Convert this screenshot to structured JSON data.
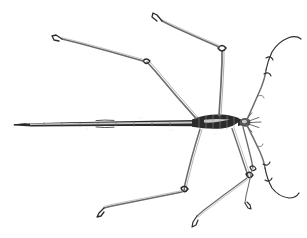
{
  "figure": {
    "view": "dorsal",
    "orientation": "head-right-abdomen-left",
    "background_color": "#ffffff",
    "ink_color": "#2b2b2b",
    "ink_soft_color": "#6b6b6b",
    "ink_faint_color": "#9a9a9a",
    "highlight_color": "#c9c9c9",
    "canvas": {
      "width": 307,
      "height": 238
    },
    "caption": "",
    "labels": []
  },
  "anatomy": {
    "abdomen": {
      "name": "abdomen",
      "tip_x": 14,
      "tip_y": 124,
      "base_x": 196,
      "base_y": 122,
      "segments": 8
    },
    "thorax": {
      "name": "thorax",
      "x": 196,
      "y": 120,
      "width": 42,
      "height": 12
    },
    "head": {
      "name": "head",
      "x": 243,
      "y": 120,
      "radius": 5
    },
    "antennae": [
      {
        "name": "antenna-upper-right",
        "side": "right",
        "position": "upper",
        "tip_x": 300,
        "tip_y": 40
      },
      {
        "name": "antenna-lower-right",
        "side": "right",
        "position": "lower",
        "tip_x": 296,
        "tip_y": 196
      }
    ],
    "legs": [
      {
        "name": "leg-foreleg-left-upper",
        "pair": "foreleg",
        "side": "upper-left",
        "femur_joint_x": 146,
        "femur_joint_y": 63,
        "tarsus_tip_x": 53,
        "tarsus_tip_y": 39
      },
      {
        "name": "leg-midleg-left-upper",
        "pair": "midleg",
        "side": "upper-middle",
        "femur_joint_x": 222,
        "femur_joint_y": 50,
        "tarsus_tip_x": 156,
        "tarsus_tip_y": 14
      },
      {
        "name": "leg-hindleg-left-lower",
        "pair": "hindleg",
        "side": "lower-left",
        "femur_joint_x": 184,
        "femur_joint_y": 191,
        "tarsus_tip_x": 100,
        "tarsus_tip_y": 212
      },
      {
        "name": "leg-hindleg-right-lower",
        "pair": "hindleg",
        "side": "lower-middle",
        "femur_joint_x": 249,
        "femur_joint_y": 178,
        "tarsus_tip_x": 194,
        "tarsus_tip_y": 224
      },
      {
        "name": "leg-midleg-right-lower",
        "pair": "midleg",
        "side": "lower-right",
        "femur_joint_x": 253,
        "femur_joint_y": 170,
        "tarsus_tip_x": 247,
        "tarsus_tip_y": 205
      }
    ]
  }
}
